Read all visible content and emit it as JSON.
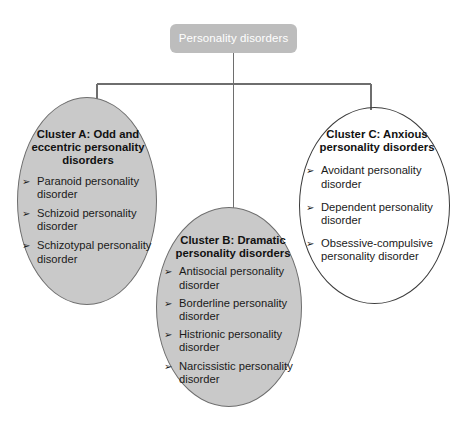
{
  "diagram": {
    "root": {
      "label": "Personality disorders"
    },
    "colors": {
      "root_fill": "#bdbdbd",
      "root_text": "#ffffff",
      "cluster_filled_fill": "#c9c9c9",
      "cluster_filled_stroke": "#6e6e6e",
      "cluster_hollow_stroke": "#3c3c3c",
      "connector_stroke": "#6e6e6e",
      "text": "#1a1a1a",
      "background": "#ffffff"
    },
    "bullet_glyph": "➢",
    "clusters": [
      {
        "id": "cluster-a",
        "title": "Cluster A: Odd and eccentric personality disorders",
        "fill": "filled",
        "items": [
          "Paranoid personality disorder",
          "Schizoid personality disorder",
          "Schizotypal personality disorder"
        ]
      },
      {
        "id": "cluster-b",
        "title": "Cluster B: Dramatic personality disorders",
        "fill": "filled",
        "items": [
          "Antisocial personality disorder",
          "Borderline personality disorder",
          "Histrionic personality disorder",
          "Narcissistic personality disorder"
        ]
      },
      {
        "id": "cluster-c",
        "title": "Cluster C: Anxious personality disorders",
        "fill": "hollow",
        "items": [
          "Avoidant personality disorder",
          "Dependent personality disorder",
          "Obsessive-compulsive personality disorder"
        ]
      }
    ]
  }
}
